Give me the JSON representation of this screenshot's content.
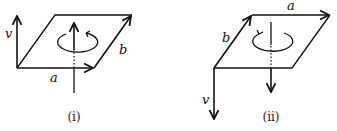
{
  "figures": [
    {
      "id": "i",
      "caption": "(i)",
      "labels": {
        "v": "v",
        "a": "a",
        "b": "b"
      },
      "axis_direction": "up",
      "rotation": "counterclockwise (viewed from above)"
    },
    {
      "id": "ii",
      "caption": "(ii)",
      "labels": {
        "v": "v",
        "a": "a",
        "b": "b"
      },
      "axis_direction": "down",
      "rotation": "clockwise (viewed from above)"
    }
  ],
  "colors": {
    "stroke": "#111111",
    "background": "#ffffff"
  }
}
